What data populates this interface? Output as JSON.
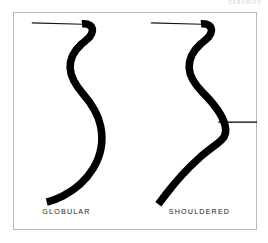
{
  "page": {
    "running_head": "CERAMICS",
    "background_color": "#ffffff"
  },
  "figure": {
    "frame_color": "#b9b9bd",
    "ink_color": "#000000",
    "plates": [
      {
        "id": "globular",
        "label": "GLOBULAR",
        "description": "Vessel profile with continuous rounded body curve",
        "rim_line": true,
        "has_shoulder_marker": false
      },
      {
        "id": "shouldered",
        "label": "SHOULDERED",
        "description": "Vessel profile with an angular carination at the shoulder",
        "rim_line": true,
        "has_shoulder_marker": true
      }
    ],
    "annotation": {
      "type": "arrow",
      "direction": "left",
      "points_to": "shoulder-carination",
      "color": "#000000"
    }
  }
}
